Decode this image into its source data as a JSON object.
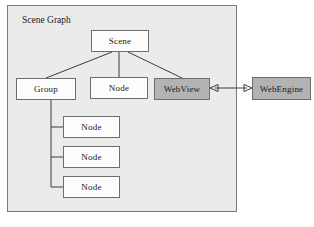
{
  "diagram": {
    "type": "block-diagram",
    "title": "Scene Graph",
    "container": {
      "label": "Scene Graph",
      "fill_color": "#ebebeb",
      "border_color": "#7a7a7a"
    },
    "colors": {
      "white_box_fill": "#fdfdfd",
      "gray_box_fill": "#b3b3b3",
      "box_border": "#6e6e6e",
      "edge_stroke": "#3c3c3c",
      "page_background": "#ffffff"
    },
    "nodes": [
      {
        "id": "scene",
        "label": "Scene",
        "fill": "white",
        "inside_container": true
      },
      {
        "id": "group",
        "label": "Group",
        "fill": "white",
        "inside_container": true
      },
      {
        "id": "node-main",
        "label": "Node",
        "fill": "white",
        "inside_container": true
      },
      {
        "id": "webview",
        "label": "WebView",
        "fill": "gray",
        "inside_container": true
      },
      {
        "id": "webengine",
        "label": "WebEngine",
        "fill": "gray",
        "inside_container": false
      },
      {
        "id": "child-0",
        "label": "Node",
        "fill": "white",
        "inside_container": true
      },
      {
        "id": "child-1",
        "label": "Node",
        "fill": "white",
        "inside_container": true
      },
      {
        "id": "child-2",
        "label": "Node",
        "fill": "white",
        "inside_container": true
      }
    ],
    "edges": [
      {
        "from": "scene",
        "to": "group",
        "style": "plain"
      },
      {
        "from": "scene",
        "to": "node-main",
        "style": "plain"
      },
      {
        "from": "scene",
        "to": "webview",
        "style": "plain"
      },
      {
        "from": "group",
        "to": "child-0",
        "style": "elbow"
      },
      {
        "from": "group",
        "to": "child-1",
        "style": "elbow"
      },
      {
        "from": "group",
        "to": "child-2",
        "style": "elbow"
      },
      {
        "from": "webview",
        "to": "webengine",
        "style": "double-arrow"
      }
    ]
  }
}
